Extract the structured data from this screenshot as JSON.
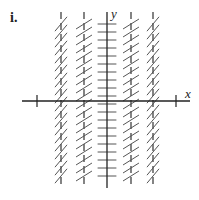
{
  "figure": {
    "panel_label": "i.",
    "x_axis_label": "x",
    "y_axis_label": "y",
    "type": "slope field",
    "colors": {
      "axes": "#222222",
      "segments": "#555555",
      "dashed_columns": "#333333"
    }
  },
  "geometry": {
    "origin": [
      107,
      101
    ],
    "x_axis": {
      "from": 22,
      "to": 190
    },
    "y_axis": {
      "from": 12,
      "to": 188
    },
    "x_ticks": [
      37,
      176
    ],
    "columns": [
      {
        "x": 61,
        "slope_deg": 50,
        "dashed": true
      },
      {
        "x": 84,
        "slope_deg": 32,
        "dashed": true
      },
      {
        "x": 107,
        "slope_deg": 0,
        "dashed": false
      },
      {
        "x": 131,
        "slope_deg": 32,
        "dashed": true
      },
      {
        "x": 153,
        "slope_deg": 50,
        "dashed": true
      }
    ],
    "row_start": 24,
    "row_end": 180,
    "row_step": 8,
    "segment_half_length": 9
  }
}
